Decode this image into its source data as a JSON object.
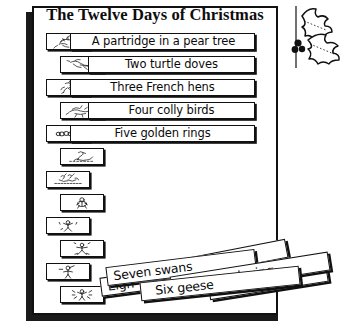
{
  "poster": {
    "title": "The Twelve Days of Christmas",
    "decoration_icon": "holly-sprig-icon"
  },
  "verses": [
    {
      "number": 1,
      "label": "A partridge in a pear tree",
      "icon": "partridge-icon",
      "placed": true,
      "icon_side": "left"
    },
    {
      "number": 2,
      "label": "Two turtle doves",
      "icon": "turtle-doves-icon",
      "placed": true,
      "icon_side": "right"
    },
    {
      "number": 3,
      "label": "Three French hens",
      "icon": "french-hen-icon",
      "placed": true,
      "icon_side": "left"
    },
    {
      "number": 4,
      "label": "Four colly birds",
      "icon": "colly-bird-icon",
      "placed": true,
      "icon_side": "right"
    },
    {
      "number": 5,
      "label": "Five golden rings",
      "icon": "golden-rings-icon",
      "placed": true,
      "icon_side": "left"
    },
    {
      "number": 6,
      "label": "",
      "icon": "goose-icon",
      "placed": false,
      "icon_side": "right"
    },
    {
      "number": 7,
      "label": "",
      "icon": "swans-icon",
      "placed": false,
      "icon_side": "left"
    },
    {
      "number": 8,
      "label": "",
      "icon": "maid-milking-icon",
      "placed": false,
      "icon_side": "right"
    },
    {
      "number": 9,
      "label": "",
      "icon": "lady-dancing-icon",
      "placed": false,
      "icon_side": "left"
    },
    {
      "number": 10,
      "label": "",
      "icon": "lord-leaping-icon",
      "placed": false,
      "icon_side": "right"
    },
    {
      "number": 11,
      "label": "",
      "icon": "piper-piping-icon",
      "placed": false,
      "icon_side": "left"
    },
    {
      "number": 12,
      "label": "",
      "icon": "drummer-drumming-icon",
      "placed": false,
      "icon_side": "right"
    }
  ],
  "scattered_labels": [
    {
      "id": "milking",
      "text": "s a-milking"
    },
    {
      "id": "swans",
      "text": "Seven swans"
    },
    {
      "id": "eight",
      "text": "Eigh"
    },
    {
      "id": "laying",
      "text": "a-laying"
    },
    {
      "id": "six",
      "text": "Six geese"
    },
    {
      "id": "swim",
      "text": "mming"
    }
  ],
  "colors": {
    "ink": "#111111",
    "paper": "#ffffff",
    "shadow": "#1a1a1a"
  }
}
